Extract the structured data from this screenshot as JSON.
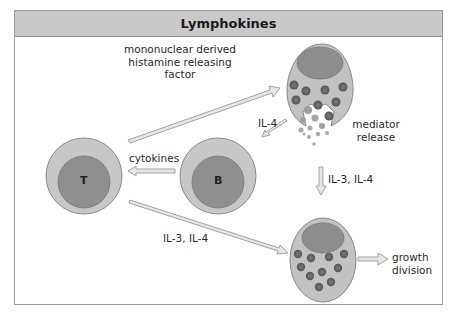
{
  "title": "Lymphokines",
  "colors": {
    "cell_outer": "#c7c7c7",
    "cell_nucleus": "#8f8f8f",
    "granule": "#6a6a6a",
    "arrow_fill": "#e6e6e6",
    "arrow_stroke": "#9a9a9a",
    "header_bg": "#c9c9c9",
    "frame": "#9a9a9a"
  },
  "cells": {
    "t_cell": {
      "label": "T"
    },
    "b_cell": {
      "label": "B"
    },
    "mast_cell_top": {
      "description": "degranulating mast cell"
    },
    "mast_cell_bottom": {
      "description": "granulated mast cell"
    }
  },
  "labels": {
    "mhrf_line1": "mononuclear derived",
    "mhrf_line2": "histamine releasing",
    "mhrf_line3": "factor",
    "il4": "IL-4",
    "mediator_line1": "mediator",
    "mediator_line2": "release",
    "cytokines": "cytokines",
    "il3_il4_vertical": "IL-3, IL-4",
    "il3_il4_diagonal": "IL-3, IL-4",
    "growth_line1": "growth",
    "growth_line2": "division"
  }
}
